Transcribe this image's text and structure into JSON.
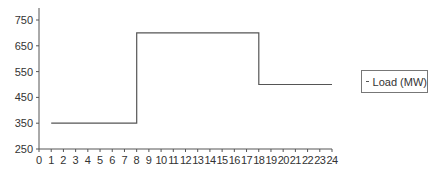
{
  "chart_data": {
    "type": "line",
    "title": "",
    "xlabel": "",
    "ylabel": "",
    "xlim": [
      0,
      24
    ],
    "ylim": [
      250,
      800
    ],
    "x_ticks": [
      0,
      1,
      2,
      3,
      4,
      5,
      6,
      7,
      8,
      9,
      10,
      11,
      12,
      13,
      14,
      15,
      16,
      17,
      18,
      19,
      20,
      21,
      22,
      23,
      24
    ],
    "y_ticks": [
      250,
      350,
      450,
      550,
      650,
      750
    ],
    "grid": false,
    "legend_position": "right",
    "series": [
      {
        "name": "Load (MW)",
        "step": true,
        "points": [
          [
            1,
            350
          ],
          [
            8,
            350
          ],
          [
            8,
            700
          ],
          [
            18,
            700
          ],
          [
            18,
            500
          ],
          [
            24,
            500
          ]
        ]
      }
    ]
  },
  "legend": {
    "label": "Load (MW)"
  },
  "colors": {
    "line": "#555555",
    "axis": "#555555",
    "text": "#333333"
  }
}
